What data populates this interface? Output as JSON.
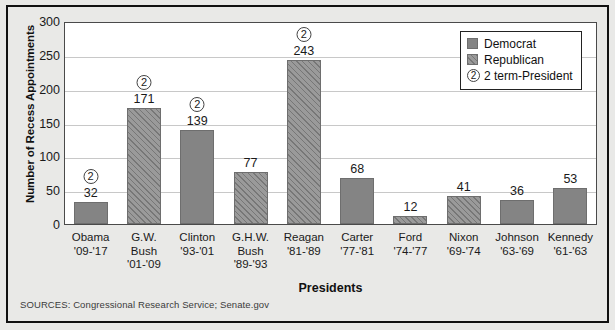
{
  "chart_data": {
    "type": "bar",
    "title": "",
    "xlabel": "Presidents",
    "ylabel": "Number of Recess Appointments",
    "ylim": [
      0,
      300
    ],
    "yticks": [
      0,
      50,
      100,
      150,
      200,
      250,
      300
    ],
    "grid": true,
    "legend_position": "top-right",
    "categories": [
      "Obama '09-'17",
      "G.W. Bush '01-'09",
      "Clinton '93-'01",
      "G.H.W. Bush '89-'93",
      "Reagan '81-'89",
      "Carter '77-'81",
      "Ford '74-'77",
      "Nixon '69-'74",
      "Johnson '63-'69",
      "Kennedy '61-'63"
    ],
    "values": [
      32,
      171,
      139,
      77,
      243,
      68,
      12,
      41,
      36,
      53
    ],
    "bars": [
      {
        "name": "Obama",
        "line1": "Obama",
        "line2": "'09-'17",
        "line3": "",
        "value": 32,
        "party": "Democrat",
        "two_term": true,
        "value_label": "32",
        "badge": "2"
      },
      {
        "name": "G.W. Bush",
        "line1": "G.W.",
        "line2": "Bush",
        "line3": "'01-'09",
        "value": 171,
        "party": "Republican",
        "two_term": true,
        "value_label": "171",
        "badge": "2"
      },
      {
        "name": "Clinton",
        "line1": "Clinton",
        "line2": "'93-'01",
        "line3": "",
        "value": 139,
        "party": "Democrat",
        "two_term": true,
        "value_label": "139",
        "badge": "2"
      },
      {
        "name": "G.H.W. Bush",
        "line1": "G.H.W.",
        "line2": "Bush",
        "line3": "'89-'93",
        "value": 77,
        "party": "Republican",
        "two_term": false,
        "value_label": "77",
        "badge": ""
      },
      {
        "name": "Reagan",
        "line1": "Reagan",
        "line2": "'81-'89",
        "line3": "",
        "value": 243,
        "party": "Republican",
        "two_term": true,
        "value_label": "243",
        "badge": "2"
      },
      {
        "name": "Carter",
        "line1": "Carter",
        "line2": "'77-'81",
        "line3": "",
        "value": 68,
        "party": "Democrat",
        "two_term": false,
        "value_label": "68",
        "badge": ""
      },
      {
        "name": "Ford",
        "line1": "Ford",
        "line2": "'74-'77",
        "line3": "",
        "value": 12,
        "party": "Republican",
        "two_term": false,
        "value_label": "12",
        "badge": ""
      },
      {
        "name": "Nixon",
        "line1": "Nixon",
        "line2": "'69-'74",
        "line3": "",
        "value": 41,
        "party": "Republican",
        "two_term": false,
        "value_label": "41",
        "badge": ""
      },
      {
        "name": "Johnson",
        "line1": "Johnson",
        "line2": "'63-'69",
        "line3": "",
        "value": 36,
        "party": "Democrat",
        "two_term": false,
        "value_label": "36",
        "badge": ""
      },
      {
        "name": "Kennedy",
        "line1": "Kennedy",
        "line2": "'61-'63",
        "line3": "",
        "value": 53,
        "party": "Democrat",
        "two_term": false,
        "value_label": "53",
        "badge": ""
      }
    ],
    "legend": [
      {
        "label": "Democrat",
        "type": "swatch",
        "style": "solid"
      },
      {
        "label": "Republican",
        "type": "swatch",
        "style": "hatched"
      },
      {
        "label": "2 term-President",
        "type": "badge",
        "badge": "2"
      }
    ],
    "colors": {
      "democrat": "#848484",
      "republican": "#9a9a9a",
      "plot_background": "#ffffff",
      "page_background": "#e9e9e7",
      "gridline": "#c8c8c8",
      "text": "#1a1a1a"
    }
  },
  "sources": "SOURCES: Congressional Research Service; Senate.gov"
}
